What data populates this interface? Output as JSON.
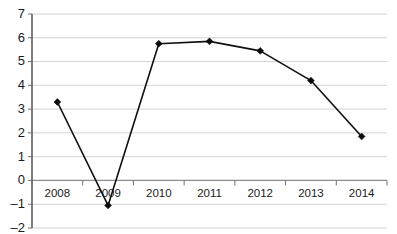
{
  "chart_data": {
    "type": "line",
    "title": "",
    "subtitle": "",
    "xlabel": "",
    "ylabel": "",
    "categories": [
      "2008",
      "2009",
      "2010",
      "2011",
      "2012",
      "2013",
      "2014"
    ],
    "values": [
      3.3,
      -1.05,
      5.75,
      5.85,
      5.45,
      4.2,
      1.85
    ],
    "series": [
      {
        "name": "",
        "values": [
          3.3,
          -1.05,
          5.75,
          5.85,
          5.45,
          4.2,
          1.85
        ]
      }
    ],
    "ylim": [
      -2,
      7
    ],
    "yticks": [
      7,
      6,
      5,
      4,
      3,
      2,
      1,
      0,
      -1,
      -2
    ],
    "ytick_labels": [
      "7",
      "6",
      "5",
      "4",
      "3",
      "2",
      "1",
      "0",
      "–1",
      "–2"
    ],
    "xlim": [
      0,
      7
    ],
    "grid": true,
    "grid_axis": "y",
    "legend": false,
    "legend_position": "none",
    "marker": "diamond",
    "annotations": [],
    "colors": {
      "line": "#101010",
      "marker": "#0c0c0c",
      "gridline": "#c8c8c8",
      "axis": "#3a3a3a",
      "zero_line": "#8d8d8d",
      "background": "#ffffff",
      "tick_label": "#1b1b1b"
    }
  }
}
